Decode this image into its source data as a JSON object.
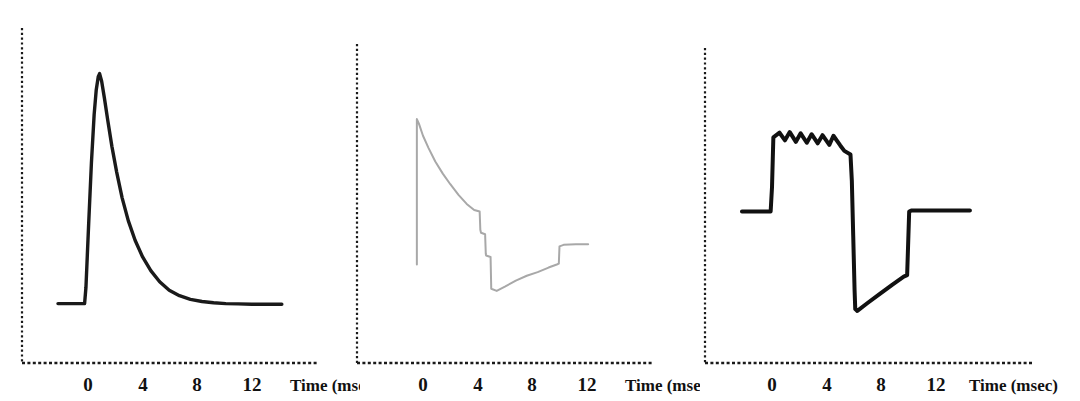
{
  "figure": {
    "background_color": "#ffffff",
    "panel_count": 3
  },
  "chart_data": [
    {
      "type": "line",
      "panel_index": 0,
      "panel_name": "panel-a",
      "title": "",
      "subtitle": "",
      "xlabel": "Time (msec)",
      "ylabel": "",
      "xlim": [
        -2.2,
        15.4
      ],
      "ylim": [
        0,
        1
      ],
      "xticks": [
        0,
        4,
        8,
        12
      ],
      "xtick_labels": [
        "0",
        "4",
        "8",
        "12"
      ],
      "yticks": [],
      "ytick_labels": [],
      "grid": false,
      "legend": null,
      "legend_position": "none",
      "annotations": [],
      "series": [
        {
          "name": "spike-decay-trace",
          "color": "#1a1a1a",
          "line_width": 3.4,
          "x": [
            -2.2,
            -0.25,
            -0.15,
            0.05,
            0.25,
            0.45,
            0.6,
            0.75,
            0.85,
            1.0,
            1.2,
            1.45,
            1.75,
            2.1,
            2.5,
            2.95,
            3.45,
            4.0,
            4.6,
            5.25,
            5.95,
            6.7,
            7.5,
            8.35,
            9.2,
            10.1,
            11.0,
            12.0,
            13.0,
            14.2
          ],
          "y": [
            0.196,
            0.196,
            0.25,
            0.46,
            0.66,
            0.82,
            0.9,
            0.945,
            0.955,
            0.93,
            0.875,
            0.8,
            0.715,
            0.63,
            0.545,
            0.47,
            0.405,
            0.35,
            0.305,
            0.268,
            0.24,
            0.222,
            0.21,
            0.203,
            0.199,
            0.196,
            0.195,
            0.194,
            0.194,
            0.194
          ]
        }
      ]
    },
    {
      "type": "line",
      "panel_index": 1,
      "panel_name": "panel-b",
      "title": "",
      "subtitle": "",
      "xlabel": "Time (msec)",
      "ylabel": "",
      "xlim": [
        -2.2,
        15.4
      ],
      "ylim": [
        0,
        1
      ],
      "xticks": [
        0,
        4,
        8,
        12
      ],
      "xtick_labels": [
        "0",
        "4",
        "8",
        "12"
      ],
      "yticks": [],
      "ytick_labels": [],
      "grid": false,
      "legend": null,
      "legend_position": "none",
      "annotations": [],
      "series": [
        {
          "name": "decay-step-recovery-trace",
          "color": "#a8a8a8",
          "line_width": 2.0,
          "x": [
            -0.45,
            -0.45,
            -0.3,
            0.0,
            0.4,
            0.9,
            1.45,
            2.0,
            2.6,
            3.2,
            3.75,
            4.15,
            4.2,
            4.25,
            4.55,
            4.6,
            4.62,
            4.95,
            5.0,
            5.4,
            6.0,
            6.8,
            7.6,
            8.4,
            9.2,
            9.8,
            9.95,
            10.0,
            10.3,
            11.2,
            12.1
          ],
          "y": [
            0.325,
            0.805,
            0.79,
            0.75,
            0.71,
            0.665,
            0.625,
            0.59,
            0.555,
            0.525,
            0.505,
            0.5,
            0.44,
            0.43,
            0.425,
            0.36,
            0.355,
            0.35,
            0.245,
            0.238,
            0.252,
            0.272,
            0.288,
            0.3,
            0.315,
            0.325,
            0.328,
            0.385,
            0.39,
            0.392,
            0.392
          ]
        }
      ]
    },
    {
      "type": "line",
      "panel_index": 2,
      "panel_name": "panel-c",
      "title": "",
      "subtitle": "",
      "xlabel": "Time (msec)",
      "ylabel": "",
      "xlim": [
        -2.2,
        15.4
      ],
      "ylim": [
        0,
        1
      ],
      "xticks": [
        0,
        4,
        8,
        12
      ],
      "xtick_labels": [
        "0",
        "4",
        "8",
        "12"
      ],
      "yticks": [],
      "ytick_labels": [],
      "grid": false,
      "legend": null,
      "legend_position": "none",
      "annotations": [],
      "series": [
        {
          "name": "square-pulse-ripple-trace",
          "color": "#111111",
          "line_width": 4.0,
          "x": [
            -2.2,
            -0.1,
            0.0,
            0.1,
            0.55,
            0.95,
            1.3,
            1.75,
            2.1,
            2.55,
            2.9,
            3.35,
            3.7,
            4.2,
            4.5,
            5.0,
            5.3,
            5.75,
            5.85,
            5.95,
            6.05,
            6.1,
            6.25,
            7.0,
            7.9,
            8.8,
            9.65,
            9.9,
            9.95,
            10.05,
            10.2,
            11.5,
            13.0,
            14.5
          ],
          "y": [
            0.5,
            0.5,
            0.58,
            0.745,
            0.76,
            0.735,
            0.762,
            0.73,
            0.758,
            0.727,
            0.755,
            0.725,
            0.752,
            0.72,
            0.75,
            0.718,
            0.7,
            0.688,
            0.6,
            0.42,
            0.24,
            0.178,
            0.172,
            0.198,
            0.228,
            0.258,
            0.285,
            0.29,
            0.36,
            0.5,
            0.503,
            0.503,
            0.503,
            0.503
          ]
        }
      ]
    }
  ],
  "panels": [
    {
      "id": "panel-a",
      "axis_color": "#1a1a1a",
      "trace_color": "#1a1a1a",
      "xlabel": "Time (msec)",
      "tick_labels": [
        "0",
        "4",
        "8",
        "12"
      ]
    },
    {
      "id": "panel-b",
      "axis_color": "#1a1a1a",
      "trace_color": "#a8a8a8",
      "xlabel": "Time (msec)",
      "tick_labels": [
        "0",
        "4",
        "8",
        "12"
      ]
    },
    {
      "id": "panel-c",
      "axis_color": "#1a1a1a",
      "trace_color": "#111111",
      "xlabel": "Time (msec)",
      "tick_labels": [
        "0",
        "4",
        "8",
        "12"
      ]
    }
  ]
}
